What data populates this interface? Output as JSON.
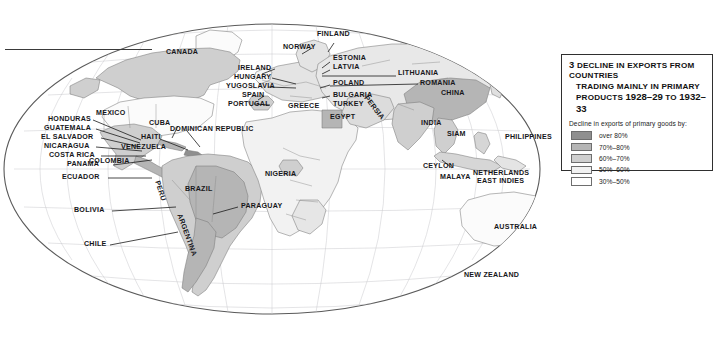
{
  "figure": {
    "number": "3",
    "title_line1": "Decline in exports from countries",
    "title_line2": "trading mainly in primary",
    "title_line3_prefix": "products",
    "title_years": "1928–29",
    "title_connector": "to",
    "title_years2": "1932–33"
  },
  "legend": {
    "subtitle": "Decline in exports of primary goods by:",
    "entries": [
      {
        "label": "over 80%",
        "color": "#8f8f8f"
      },
      {
        "label": "70%–80%",
        "color": "#b5b5b5"
      },
      {
        "label": "60%–70%",
        "color": "#cfcfcf"
      },
      {
        "label": "50%–60%",
        "color": "#f2f2f2"
      },
      {
        "label": "30%–50%",
        "color": "#ffffff"
      }
    ]
  },
  "map": {
    "labels": [
      {
        "name": "canada",
        "text": "CANADA"
      },
      {
        "name": "mexico",
        "text": "MEXICO"
      },
      {
        "name": "cuba",
        "text": "CUBA"
      },
      {
        "name": "haiti",
        "text": "HAITI"
      },
      {
        "name": "dominican-republic",
        "text": "DOMINICAN REPUBLIC"
      },
      {
        "name": "honduras",
        "text": "HONDURAS"
      },
      {
        "name": "guatemala",
        "text": "GUATEMALA"
      },
      {
        "name": "el-salvador",
        "text": "EL SALVADOR"
      },
      {
        "name": "nicaragua",
        "text": "NICARAGUA"
      },
      {
        "name": "costa-rica",
        "text": "COSTA RICA"
      },
      {
        "name": "panama",
        "text": "PANAMA"
      },
      {
        "name": "colombia",
        "text": "COLOMBIA"
      },
      {
        "name": "venezuela",
        "text": "VENEZUELA"
      },
      {
        "name": "ecuador",
        "text": "ECUADOR"
      },
      {
        "name": "peru",
        "text": "PERU"
      },
      {
        "name": "brazil",
        "text": "BRAZIL"
      },
      {
        "name": "bolivia",
        "text": "BOLIVIA"
      },
      {
        "name": "paraguay",
        "text": "PARAGUAY"
      },
      {
        "name": "argentina",
        "text": "ARGENTINA"
      },
      {
        "name": "chile",
        "text": "CHILE"
      },
      {
        "name": "ireland",
        "text": "IRELAND"
      },
      {
        "name": "norway",
        "text": "NORWAY"
      },
      {
        "name": "finland",
        "text": "FINLAND"
      },
      {
        "name": "estonia",
        "text": "ESTONIA"
      },
      {
        "name": "latvia",
        "text": "LATVIA"
      },
      {
        "name": "lithuania",
        "text": "LITHUANIA"
      },
      {
        "name": "poland",
        "text": "POLAND"
      },
      {
        "name": "hungary",
        "text": "HUNGARY"
      },
      {
        "name": "yugoslavia",
        "text": "YUGOSLAVIA"
      },
      {
        "name": "romania",
        "text": "ROMANIA"
      },
      {
        "name": "bulgaria",
        "text": "BULGARIA"
      },
      {
        "name": "turkey",
        "text": "TURKEY"
      },
      {
        "name": "greece",
        "text": "GREECE"
      },
      {
        "name": "spain",
        "text": "SPAIN"
      },
      {
        "name": "portugal",
        "text": "PORTUGAL"
      },
      {
        "name": "persia",
        "text": "PERSIA"
      },
      {
        "name": "egypt",
        "text": "EGYPT"
      },
      {
        "name": "nigeria",
        "text": "NIGERIA"
      },
      {
        "name": "china",
        "text": "CHINA"
      },
      {
        "name": "india",
        "text": "INDIA"
      },
      {
        "name": "siam",
        "text": "SIAM"
      },
      {
        "name": "ceylon",
        "text": "CEYLON"
      },
      {
        "name": "malaya",
        "text": "MALAYA"
      },
      {
        "name": "philippines",
        "text": "PHILIPPINES"
      },
      {
        "name": "netherlands-east-indies-1",
        "text": "NETHERLANDS"
      },
      {
        "name": "netherlands-east-indies-2",
        "text": "EAST INDIES"
      },
      {
        "name": "australia",
        "text": "AUSTRALIA"
      },
      {
        "name": "new-zealand",
        "text": "NEW ZEALAND"
      }
    ]
  }
}
